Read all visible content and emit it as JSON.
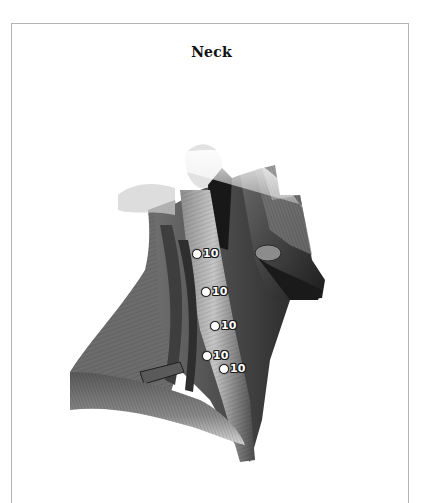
{
  "page": {
    "title": "Neck"
  },
  "illustration": {
    "subject": "neck-muscles-lateral-view",
    "style": "grayscale",
    "markers": [
      {
        "label": "10",
        "x": 197,
        "y": 253
      },
      {
        "label": "10",
        "x": 206,
        "y": 291
      },
      {
        "label": "10",
        "x": 215,
        "y": 325
      },
      {
        "label": "10",
        "x": 207,
        "y": 355
      },
      {
        "label": "10",
        "x": 224,
        "y": 368
      }
    ]
  },
  "colors": {
    "border": "#b4b4b4",
    "title": "#111111",
    "marker_fill": "#ffffff",
    "marker_outline": "#1a1a1a"
  }
}
